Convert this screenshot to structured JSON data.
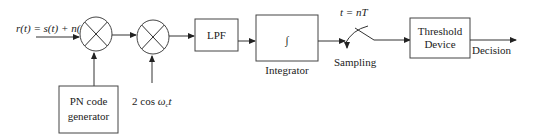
{
  "diagram": {
    "title": "",
    "colors": {
      "stroke": "#333333",
      "text": "#222222",
      "background": "#ffffff"
    },
    "input_signal": {
      "label": "r(t) = s(t) + n(t)"
    },
    "mixer1": {
      "icon": "multiplier-icon"
    },
    "mixer2": {
      "icon": "multiplier-icon"
    },
    "pn_generator": {
      "line1": "PN code",
      "line2": "generator"
    },
    "carrier": {
      "label": "2 cos ωct"
    },
    "lpf": {
      "label": "LPF"
    },
    "integrator": {
      "symbol": "∫",
      "caption": "Integrator"
    },
    "sampler": {
      "time_label": "t = nT",
      "caption": "Sampling",
      "icon": "switch-icon"
    },
    "threshold": {
      "line1": "Threshold",
      "line2": "Device"
    },
    "output": {
      "label": "Decision"
    }
  }
}
